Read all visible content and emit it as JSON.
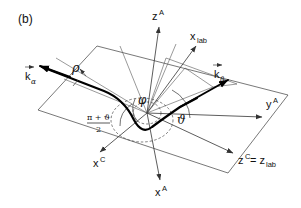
{
  "figure": {
    "panel_label": "(b)",
    "type": "scattering-geometry-diagram",
    "background_color": "#ffffff",
    "line_color": "#111111"
  },
  "axes": [
    {
      "id": "z-A",
      "label_base": "z",
      "label_sup": "A",
      "label_sub": "",
      "name": "z-axis-atomic"
    },
    {
      "id": "x-lab",
      "label_base": "x",
      "label_sup": "",
      "label_sub": "lab",
      "name": "x-axis-lab"
    },
    {
      "id": "y-A",
      "label_base": "y",
      "label_sup": "A",
      "label_sub": "",
      "name": "y-axis-atomic"
    },
    {
      "id": "x-A",
      "label_base": "x",
      "label_sup": "A",
      "label_sub": "",
      "name": "x-axis-atomic"
    },
    {
      "id": "x-C",
      "label_base": "x",
      "label_sup": "C",
      "label_sub": "",
      "name": "x-axis-collision"
    },
    {
      "id": "z-C-lab",
      "label_base": "z",
      "label_sup": "C",
      "label_sub": "",
      "name": "z-axis-collision",
      "equals": "= z",
      "equals_sub": "lab"
    }
  ],
  "vectors": [
    {
      "id": "k-alpha",
      "label_base": "k",
      "label_sub": "α",
      "arrow_over": true,
      "name": "k-alpha-vector"
    },
    {
      "id": "k-beta",
      "label_base": "k",
      "label_sub": "β",
      "arrow_over": true,
      "name": "k-beta-vector"
    }
  ],
  "angles": [
    {
      "id": "phi",
      "symbol": "φ",
      "name": "azimuthal-angle-phi"
    },
    {
      "id": "theta",
      "symbol": "ϑ",
      "name": "scattering-angle-theta"
    },
    {
      "id": "half-sum",
      "numerator": "π + ϑ",
      "denominator": "2",
      "name": "half-sum-angle"
    }
  ],
  "annotations": [
    {
      "id": "rho",
      "symbol": "ρ",
      "name": "impact-parameter-rho"
    }
  ]
}
